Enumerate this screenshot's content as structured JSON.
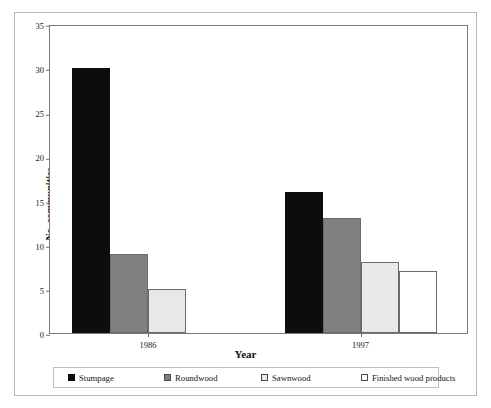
{
  "chart_data": {
    "type": "bar",
    "title": "",
    "xlabel": "Year",
    "ylabel": "No. communities",
    "categories": [
      "1986",
      "1997"
    ],
    "ylim": [
      0,
      35
    ],
    "yticks": [
      0,
      5,
      10,
      15,
      20,
      25,
      30,
      35
    ],
    "grid": false,
    "legend_position": "bottom",
    "series": [
      {
        "name": "Stumpage",
        "color": "#0d0d0d",
        "values": [
          30,
          16
        ]
      },
      {
        "name": "Roundwood",
        "color": "#808080",
        "values": [
          9,
          13
        ]
      },
      {
        "name": "Sawnwood",
        "color": "#e8e8e8",
        "values": [
          5,
          8
        ]
      },
      {
        "name": "Finished wood products",
        "color": "#ffffff",
        "values": [
          0,
          7
        ]
      }
    ]
  },
  "axes": {
    "y_title": "No. communities",
    "x_title": "Year",
    "y_tick_labels": [
      "0",
      "5",
      "10",
      "15",
      "20",
      "25",
      "30",
      "35"
    ],
    "x_tick_labels": [
      "1986",
      "1997"
    ]
  },
  "legend": {
    "items": [
      {
        "label": "Stumpage",
        "swatch": "stumpage-swatch-icon"
      },
      {
        "label": "Roundwood",
        "swatch": "roundwood-swatch-icon"
      },
      {
        "label": "Sawnwood",
        "swatch": "sawnwood-swatch-icon"
      },
      {
        "label": "Finished wood products",
        "swatch": "finished-wood-products-swatch-icon"
      }
    ]
  }
}
